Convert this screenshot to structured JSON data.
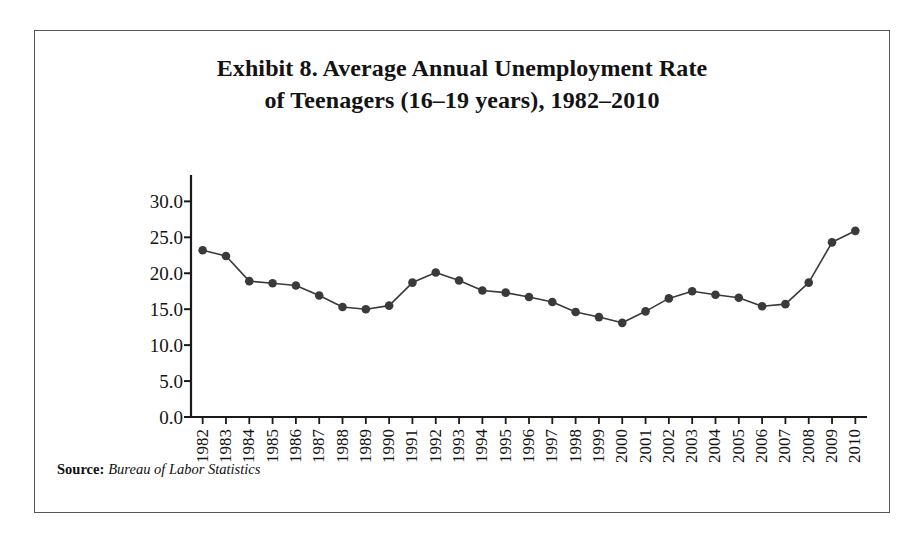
{
  "figure": {
    "title_line1": "Exhibit 8. Average Annual Unemployment Rate",
    "title_line2": "of Teenagers (16–19 years), 1982–2010",
    "source_label": "Source:",
    "source_value": "Bureau of Labor Statistics",
    "border_color": "#555555",
    "background_color": "#ffffff"
  },
  "chart_data": {
    "type": "line",
    "title": "Exhibit 8. Average Annual Unemployment Rate of Teenagers (16–19 years), 1982–2010",
    "xlabel": "",
    "ylabel": "Unemployment Rate",
    "categories": [
      "1982",
      "1983",
      "1984",
      "1985",
      "1986",
      "1987",
      "1988",
      "1989",
      "1990",
      "1991",
      "1992",
      "1993",
      "1994",
      "1995",
      "1996",
      "1997",
      "1998",
      "1999",
      "2000",
      "2001",
      "2002",
      "2003",
      "2004",
      "2005",
      "2006",
      "2007",
      "2008",
      "2009",
      "2010"
    ],
    "values": [
      23.2,
      22.4,
      18.9,
      18.6,
      18.3,
      16.9,
      15.3,
      15.0,
      15.5,
      18.7,
      20.1,
      19.0,
      17.6,
      17.3,
      16.7,
      16.0,
      14.6,
      13.9,
      13.1,
      14.7,
      16.5,
      17.5,
      17.0,
      16.6,
      15.4,
      15.7,
      18.7,
      24.3,
      25.9
    ],
    "series": [
      {
        "name": "Unemployment Rate",
        "values": [
          23.2,
          22.4,
          18.9,
          18.6,
          18.3,
          16.9,
          15.3,
          15.0,
          15.5,
          18.7,
          20.1,
          19.0,
          17.6,
          17.3,
          16.7,
          16.0,
          14.6,
          13.9,
          13.1,
          14.7,
          16.5,
          17.5,
          17.0,
          16.6,
          15.4,
          15.7,
          18.7,
          24.3,
          25.9
        ],
        "color": "#333333",
        "marker": "circle"
      }
    ],
    "y_tick_labels": [
      "30.0",
      "25.0",
      "20.0",
      "15.0",
      "10.0",
      "5.0",
      "0.0"
    ],
    "y_ticks": [
      30.0,
      25.0,
      20.0,
      15.0,
      10.0,
      5.0,
      0.0
    ],
    "ylim": [
      0.0,
      32.0
    ],
    "grid": false,
    "legend": "none",
    "line_color": "#3a3a3a",
    "marker_color": "#3a3a3a",
    "axis_color": "#1a1a1a"
  }
}
